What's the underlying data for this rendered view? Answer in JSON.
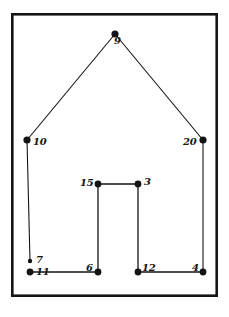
{
  "figure": {
    "background_color": "#ffffff",
    "ink_color": "#141414",
    "frame": {
      "name": "outer-border-frame",
      "x": 11,
      "y": 13,
      "width": 207,
      "height": 284,
      "stroke_width": 2.6
    },
    "vertices": [
      {
        "id": "v9",
        "label": "9",
        "x": 115,
        "y": 34,
        "dot_radius": 3.6,
        "label_dx": -1,
        "label_dy": 7,
        "label_anchor": "below-center"
      },
      {
        "id": "v10",
        "label": "10",
        "x": 27,
        "y": 140,
        "dot_radius": 3.6,
        "label_dx": 6,
        "label_dy": 2,
        "label_anchor": "right"
      },
      {
        "id": "v20",
        "label": "20",
        "x": 203,
        "y": 140,
        "dot_radius": 3.6,
        "label_dx": -20,
        "label_dy": 2,
        "label_anchor": "left"
      },
      {
        "id": "v15",
        "label": "15",
        "x": 98,
        "y": 184,
        "dot_radius": 3.4,
        "label_dx": -18,
        "label_dy": -1,
        "label_anchor": "left"
      },
      {
        "id": "v3",
        "label": "3",
        "x": 138,
        "y": 184,
        "dot_radius": 3.4,
        "label_dx": 6,
        "label_dy": -2,
        "label_anchor": "right"
      },
      {
        "id": "v7",
        "label": "7",
        "x": 30,
        "y": 261,
        "dot_radius": 2.2,
        "label_dx": 6,
        "label_dy": -1,
        "label_anchor": "right"
      },
      {
        "id": "v11",
        "label": "11",
        "x": 30,
        "y": 272,
        "dot_radius": 3.4,
        "label_dx": 6,
        "label_dy": 0,
        "label_anchor": "right"
      },
      {
        "id": "v6",
        "label": "6",
        "x": 98,
        "y": 272,
        "dot_radius": 3.4,
        "label_dx": -12,
        "label_dy": -4,
        "label_anchor": "upper-left"
      },
      {
        "id": "v12",
        "label": "12",
        "x": 138,
        "y": 272,
        "dot_radius": 3.4,
        "label_dx": 4,
        "label_dy": -4,
        "label_anchor": "upper-right"
      },
      {
        "id": "v4",
        "label": "4",
        "x": 203,
        "y": 272,
        "dot_radius": 3.4,
        "label_dx": -11,
        "label_dy": -4,
        "label_anchor": "upper-left"
      }
    ],
    "edges": [
      {
        "name": "roof-left-edge",
        "from": "v10",
        "to": "v9",
        "stroke_width": 1.1
      },
      {
        "name": "roof-right-edge",
        "from": "v9",
        "to": "v20",
        "stroke_width": 1.1
      },
      {
        "name": "wall-left-edge",
        "from": "v10",
        "to": "v7",
        "stroke_width": 1.1
      },
      {
        "name": "wall-right-edge",
        "from": "v20",
        "to": "v4",
        "stroke_width": 1.1
      },
      {
        "name": "floor-left-edge",
        "from": "v11",
        "to": "v6",
        "stroke_width": 1.3
      },
      {
        "name": "floor-right-edge",
        "from": "v12",
        "to": "v4",
        "stroke_width": 1.3
      },
      {
        "name": "door-top-edge",
        "from": "v15",
        "to": "v3",
        "stroke_width": 1.3
      },
      {
        "name": "door-left-edge",
        "from": "v15",
        "to": "v6",
        "stroke_width": 1.3
      },
      {
        "name": "door-right-edge",
        "from": "v3",
        "to": "v12",
        "stroke_width": 1.3
      }
    ]
  }
}
